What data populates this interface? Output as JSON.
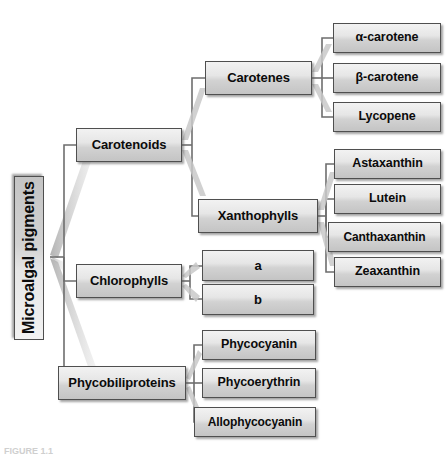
{
  "figure": {
    "type": "hierarchy-tree",
    "orientation": "left-to-right",
    "caption": "FIGURE 1.1",
    "root": {
      "label": "Microalgal pigments"
    },
    "level2": [
      {
        "label": "Carotenoids"
      },
      {
        "label": "Chlorophylls"
      },
      {
        "label": "Phycobiliproteins"
      }
    ],
    "level3": {
      "carotenoids": [
        {
          "label": "Carotenes"
        },
        {
          "label": "Xanthophylls"
        }
      ],
      "chlorophylls": [
        {
          "label": "a"
        },
        {
          "label": "b"
        }
      ],
      "phycobiliproteins": [
        {
          "label": "Phycocyanin"
        },
        {
          "label": "Phycoerythrin"
        },
        {
          "label": "Allophycocyanin"
        }
      ]
    },
    "level4": {
      "carotenes": [
        {
          "label": "α-carotene"
        },
        {
          "label": "β-carotene"
        },
        {
          "label": "Lycopene"
        }
      ],
      "xanthophylls": [
        {
          "label": "Astaxanthin"
        },
        {
          "label": "Lutein"
        },
        {
          "label": "Canthaxanthin"
        },
        {
          "label": "Zeaxanthin"
        }
      ]
    },
    "colors": {
      "box_fill_top": "#f2f2f2",
      "box_fill_bottom": "#c4c4c4",
      "box_border": "#4f4f4f",
      "connector": "#6e6e6e",
      "connector_shadow": "#b4b4b4",
      "text": "#0b0b0b",
      "background": "#ffffff"
    }
  }
}
